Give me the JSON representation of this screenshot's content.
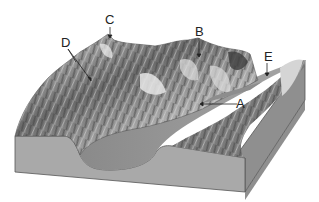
{
  "diagram": {
    "labels": [
      {
        "id": "A",
        "text": "A",
        "x": 236,
        "y": 97,
        "points_to": "valley-floor"
      },
      {
        "id": "B",
        "text": "B",
        "x": 195,
        "y": 25,
        "points_to": "ridge-peak"
      },
      {
        "id": "C",
        "text": "C",
        "x": 105,
        "y": 13,
        "points_to": "summit-peak"
      },
      {
        "id": "D",
        "text": "D",
        "x": 61,
        "y": 36,
        "points_to": "two-peaks-left"
      },
      {
        "id": "E",
        "text": "E",
        "x": 264,
        "y": 50,
        "points_to": "u-shaped-valley-notch"
      }
    ],
    "colors": {
      "block_front": "#a9a9a9",
      "block_side": "#8f8f8f",
      "terrain_dark": "#4a4a4a",
      "terrain_light": "#d8d8d8",
      "valley": "#9a9a9a",
      "outline": "#555555"
    }
  }
}
